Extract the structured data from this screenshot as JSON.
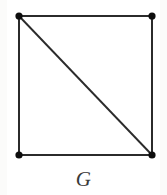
{
  "figure": {
    "caption": "G",
    "canvas": {
      "width": 167,
      "height": 195
    },
    "background_color": "#ffffff",
    "edge_color": "#2b2b2b",
    "vertex_color": "#0d0d0d",
    "caption_color": "#3a3a3a"
  },
  "chart_data": {
    "type": "diagram",
    "title": "G",
    "node_count": 4,
    "edge_count": 5,
    "nodes": [
      {
        "id": "v1",
        "label": "",
        "x": 19,
        "y": 16,
        "r": 3.6
      },
      {
        "id": "v2",
        "label": "",
        "x": 152,
        "y": 16,
        "r": 3.6
      },
      {
        "id": "v3",
        "label": "",
        "x": 19,
        "y": 155,
        "r": 3.6
      },
      {
        "id": "v4",
        "label": "",
        "x": 152,
        "y": 155,
        "r": 3.6
      }
    ],
    "edges": [
      {
        "id": "e-top",
        "from": "v1",
        "to": "v2",
        "x1": 19,
        "y1": 16,
        "x2": 152,
        "y2": 16,
        "kind": "side"
      },
      {
        "id": "e-right",
        "from": "v2",
        "to": "v4",
        "x1": 152,
        "y1": 16,
        "x2": 152,
        "y2": 155,
        "kind": "side"
      },
      {
        "id": "e-bottom",
        "from": "v3",
        "to": "v4",
        "x1": 19,
        "y1": 155,
        "x2": 152,
        "y2": 155,
        "kind": "side"
      },
      {
        "id": "e-left",
        "from": "v1",
        "to": "v3",
        "x1": 19,
        "y1": 16,
        "x2": 19,
        "y2": 155,
        "kind": "side"
      },
      {
        "id": "e-diag",
        "from": "v1",
        "to": "v4",
        "x1": 19,
        "y1": 16,
        "x2": 152,
        "y2": 155,
        "kind": "diagonal"
      }
    ],
    "degrees": {
      "v1": 3,
      "v2": 2,
      "v3": 2,
      "v4": 3
    },
    "xlabel": "",
    "ylabel": "",
    "grid": false,
    "legend": false
  }
}
